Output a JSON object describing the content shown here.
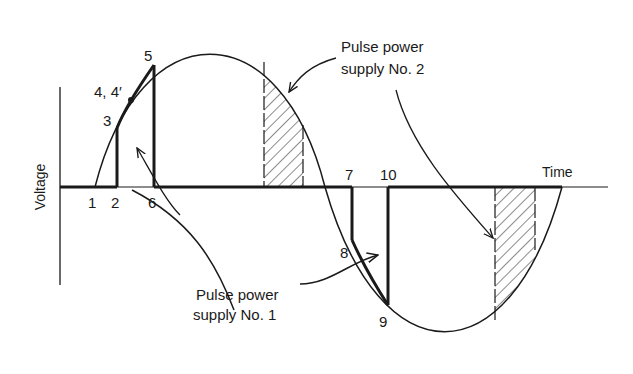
{
  "diagram": {
    "axes": {
      "y_label": "Voltage",
      "x_label": "Time"
    },
    "points": {
      "p1": "1",
      "p2": "2",
      "p3": "3",
      "p4": "4, 4′",
      "p5": "5",
      "p6": "6",
      "p7": "7",
      "p8": "8",
      "p9": "9",
      "p10": "10"
    },
    "callouts": {
      "supply1_line1": "Pulse power",
      "supply1_line2": "supply No. 1",
      "supply2_line1": "Pulse power",
      "supply2_line2": "supply No. 2"
    },
    "colors": {
      "ink": "#1a1a1a",
      "background": "#ffffff"
    }
  }
}
